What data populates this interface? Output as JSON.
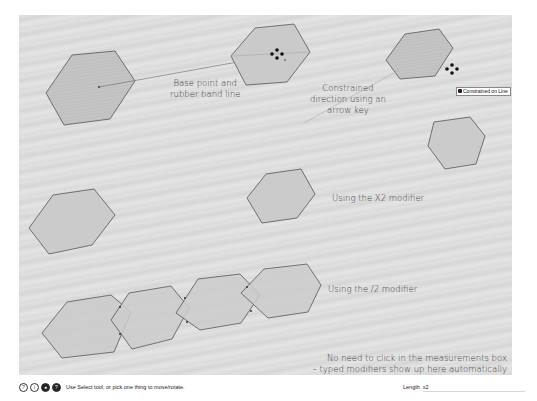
{
  "annotations": {
    "base_point": [
      "Base point and",
      "rubber band line"
    ],
    "constrained": [
      "Constrained",
      "direction using an",
      "arrow key"
    ],
    "x2_modifier": "Using the X2 modifier",
    "div2_modifier": "Using the /2 modifier",
    "measurements_note": [
      "No need to click in the measurements box",
      "– typed modifiers show up here automatically"
    ]
  },
  "tooltip": {
    "text": "Constrained on Line"
  },
  "statusbar": {
    "icons": [
      {
        "name": "help-icon",
        "glyph": "?"
      },
      {
        "name": "info-icon",
        "glyph": "i"
      },
      {
        "name": "user-icon",
        "glyph": "●"
      },
      {
        "name": "instructor-icon",
        "glyph": "?"
      }
    ],
    "message": "Use Select tool, or pick one thing to move/rotate."
  },
  "measurements": {
    "label": "Length",
    "value": "x2"
  },
  "colors": {
    "hexagon_fill": "#c9c9c9",
    "hexagon_stroke": "#555555",
    "canvas_bg": "#dcdcdc"
  }
}
